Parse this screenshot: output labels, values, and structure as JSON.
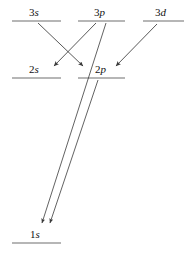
{
  "diagram": {
    "type": "energy-level-diagram",
    "title": "",
    "background_color": "#ffffff",
    "line_color": "#6f6f6f",
    "arrow_color": "#3a3a3a",
    "text_color": "#111111",
    "width": 184,
    "height": 258,
    "levels": [
      {
        "id": "3s",
        "n": "3",
        "l": "s",
        "label": "3s",
        "line_x1": 12,
        "line_x2": 61,
        "line_y": 21,
        "label_x": 29,
        "label_y": 7
      },
      {
        "id": "3p",
        "n": "3",
        "l": "p",
        "label": "3p",
        "line_x1": 78,
        "line_x2": 125,
        "line_y": 21,
        "label_x": 94,
        "label_y": 7
      },
      {
        "id": "3d",
        "n": "3",
        "l": "d",
        "label": "3d",
        "line_x1": 143,
        "line_x2": 184,
        "line_y": 21,
        "label_x": 155,
        "label_y": 7
      },
      {
        "id": "2s",
        "n": "2",
        "l": "s",
        "label": "2s",
        "line_x1": 12,
        "line_x2": 61,
        "line_y": 78,
        "label_x": 29,
        "label_y": 64
      },
      {
        "id": "2p",
        "n": "2",
        "l": "p",
        "label": "2p",
        "line_x1": 78,
        "line_x2": 125,
        "line_y": 78,
        "label_x": 95,
        "label_y": 64
      },
      {
        "id": "1s",
        "n": "1",
        "l": "s",
        "label": "1s",
        "line_x1": 12,
        "line_x2": 61,
        "line_y": 243,
        "label_x": 30,
        "label_y": 229
      }
    ],
    "transitions": [
      {
        "id": "3s-to-2p",
        "from": "3s",
        "to": "2p",
        "x1": 38,
        "y1": 23,
        "x2": 83,
        "y2": 66
      },
      {
        "id": "3p-to-2s",
        "from": "3p",
        "to": "2s",
        "x1": 96,
        "y1": 23,
        "x2": 54,
        "y2": 66
      },
      {
        "id": "3d-to-2p",
        "from": "3d",
        "to": "2p",
        "x1": 157,
        "y1": 24,
        "x2": 116,
        "y2": 66
      },
      {
        "id": "3p-to-1s",
        "from": "3p",
        "to": "1s",
        "x1": 106,
        "y1": 23,
        "x2": 42,
        "y2": 223
      },
      {
        "id": "2p-to-1s",
        "from": "2p",
        "to": "1s",
        "x1": 98,
        "y1": 80,
        "x2": 50,
        "y2": 223
      }
    ]
  }
}
